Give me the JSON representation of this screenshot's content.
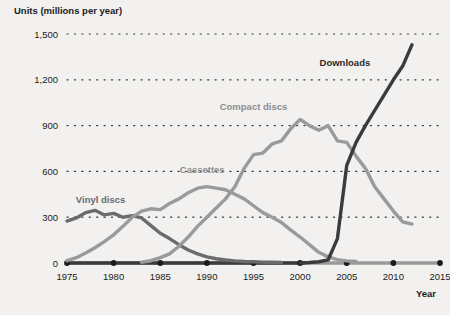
{
  "chart_data": {
    "type": "line",
    "title": "Units (millions per year)",
    "ylabel": "Units (millions per year)",
    "xlabel": "Year",
    "grid": true,
    "legend_position": "inline-labels",
    "xlim": [
      1975,
      2015
    ],
    "ylim": [
      0,
      1500
    ],
    "y_ticks": [
      0,
      300,
      600,
      900,
      1200,
      1500
    ],
    "y_tick_labels": [
      "0",
      "300",
      "600",
      "900",
      "1,200",
      "1,500"
    ],
    "x_ticks": [
      1975,
      1980,
      1985,
      1990,
      1995,
      2000,
      2005,
      2010,
      2015
    ],
    "x_tick_labels": [
      "1975",
      "1980",
      "1985",
      "1990",
      "1995",
      "2000",
      "2005",
      "2010",
      "2015"
    ],
    "series": [
      {
        "name": "Vinyl discs",
        "color": "#6b6b6b",
        "label_x": 1978.6,
        "label_y": 395,
        "x": [
          1975,
          1976,
          1977,
          1978,
          1979,
          1980,
          1981,
          1982,
          1983,
          1984,
          1985,
          1986,
          1987,
          1988,
          1989,
          1990,
          1991,
          1992,
          1993,
          1994,
          1995,
          1996,
          1997,
          1998
        ],
        "values": [
          275,
          295,
          330,
          345,
          315,
          325,
          300,
          310,
          295,
          245,
          195,
          160,
          120,
          85,
          60,
          40,
          28,
          20,
          14,
          10,
          8,
          6,
          5,
          4
        ]
      },
      {
        "name": "Cassettes",
        "color": "#9a9a9a",
        "label_x": 1989.5,
        "label_y": 590,
        "x": [
          1975,
          1976,
          1977,
          1978,
          1979,
          1980,
          1981,
          1982,
          1983,
          1984,
          1985,
          1986,
          1987,
          1988,
          1989,
          1990,
          1991,
          1992,
          1993,
          1994,
          1995,
          1996,
          1997,
          1998,
          1999,
          2000,
          2001,
          2002,
          2003,
          2004,
          2005,
          2006
        ],
        "values": [
          15,
          35,
          65,
          100,
          140,
          185,
          240,
          300,
          340,
          355,
          350,
          390,
          420,
          460,
          490,
          500,
          490,
          480,
          450,
          420,
          375,
          330,
          300,
          265,
          215,
          170,
          120,
          70,
          40,
          22,
          14,
          10
        ]
      },
      {
        "name": "Compact discs",
        "color": "#9a9a9a",
        "label_x": 1995.0,
        "label_y": 1000,
        "x": [
          1983,
          1984,
          1985,
          1986,
          1987,
          1988,
          1989,
          1990,
          1991,
          1992,
          1993,
          1994,
          1995,
          1996,
          1997,
          1998,
          1999,
          2000,
          2001,
          2002,
          2003,
          2004,
          2005,
          2006,
          2007,
          2008,
          2009,
          2010,
          2011,
          2012
        ],
        "values": [
          5,
          15,
          35,
          60,
          110,
          170,
          240,
          300,
          360,
          420,
          500,
          620,
          710,
          720,
          780,
          800,
          880,
          940,
          900,
          870,
          900,
          800,
          790,
          700,
          620,
          500,
          420,
          340,
          270,
          255
        ]
      },
      {
        "name": "Downloads",
        "color": "#3b3b3b",
        "label_x": 2004.8,
        "label_y": 1290,
        "x": [
          2000,
          2001,
          2002,
          2003,
          2004,
          2005,
          2006,
          2007,
          2008,
          2009,
          2010,
          2011,
          2012
        ],
        "values": [
          0,
          3,
          8,
          20,
          160,
          640,
          790,
          900,
          1000,
          1100,
          1200,
          1290,
          1430
        ]
      }
    ],
    "baseline_marker_years": [
      1975,
      1980,
      1985,
      1990,
      1995,
      2000,
      2005,
      2010,
      2015
    ]
  },
  "axis": {
    "y_title": "Units (millions per year)",
    "x_title": "Year"
  }
}
